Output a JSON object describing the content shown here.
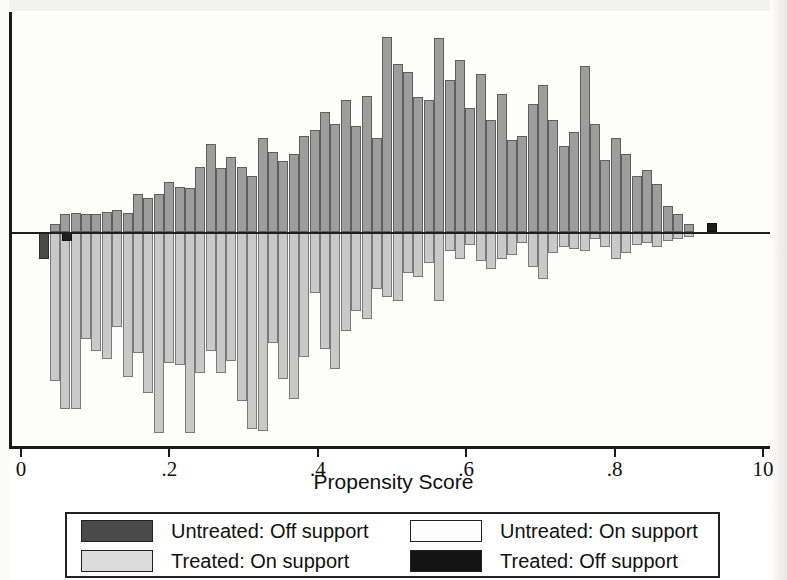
{
  "chart_data": {
    "type": "bar",
    "title": "",
    "xlabel": "Propensity Score",
    "ylabel": "",
    "xlim": [
      0,
      1
    ],
    "xticks": [
      0,
      0.2,
      0.4,
      0.6,
      0.8,
      1.0
    ],
    "xticklabels": [
      "0",
      ".2",
      ".4",
      ".6",
      ".8",
      "10"
    ],
    "grid": false,
    "legend_position": "below-axis",
    "orientation": "back-to-back histogram (untreated above zero, treated below zero)",
    "bin_width": 0.0125,
    "series": [
      {
        "name": "Untreated: On support",
        "color": "#9d9d9d",
        "direction": "up",
        "x": [
          0.034,
          0.047,
          0.061,
          0.075,
          0.089,
          0.103,
          0.117,
          0.131,
          0.145,
          0.159,
          0.173,
          0.187,
          0.201,
          0.215,
          0.229,
          0.243,
          0.257,
          0.271,
          0.285,
          0.299,
          0.313,
          0.327,
          0.341,
          0.355,
          0.369,
          0.383,
          0.397,
          0.411,
          0.425,
          0.439,
          0.453,
          0.467,
          0.481,
          0.495,
          0.509,
          0.523,
          0.537,
          0.551,
          0.565,
          0.579,
          0.593,
          0.607,
          0.621,
          0.635,
          0.649,
          0.663,
          0.677,
          0.691,
          0.705,
          0.719,
          0.733,
          0.747,
          0.761,
          0.775,
          0.789,
          0.803,
          0.817,
          0.831,
          0.845,
          0.859,
          0.873,
          0.887,
          0.901,
          0.915
        ],
        "values": [
          0,
          8,
          18,
          19,
          18,
          18,
          20,
          22,
          19,
          38,
          34,
          38,
          50,
          45,
          44,
          65,
          88,
          64,
          75,
          65,
          56,
          94,
          80,
          71,
          78,
          96,
          102,
          120,
          108,
          132,
          106,
          136,
          94,
          195,
          168,
          160,
          135,
          132,
          194,
          152,
          172,
          124,
          158,
          112,
          138,
          92,
          96,
          128,
          147,
          112,
          86,
          100,
          166,
          108,
          72,
          94,
          78,
          56,
          62,
          48,
          26,
          18,
          8,
          0
        ]
      },
      {
        "name": "Untreated: Off support",
        "color": "#4a4a4a",
        "direction": "down",
        "x": [
          0.033
        ],
        "values": [
          26
        ]
      },
      {
        "name": "Treated: On support",
        "color": "#c9c9c9",
        "direction": "down",
        "x": [
          0.047,
          0.061,
          0.075,
          0.089,
          0.103,
          0.117,
          0.131,
          0.145,
          0.159,
          0.173,
          0.187,
          0.201,
          0.215,
          0.229,
          0.243,
          0.257,
          0.271,
          0.285,
          0.299,
          0.313,
          0.327,
          0.341,
          0.355,
          0.369,
          0.383,
          0.397,
          0.411,
          0.425,
          0.439,
          0.453,
          0.467,
          0.481,
          0.495,
          0.509,
          0.523,
          0.537,
          0.551,
          0.565,
          0.579,
          0.593,
          0.607,
          0.621,
          0.635,
          0.649,
          0.663,
          0.677,
          0.691,
          0.705,
          0.719,
          0.733,
          0.747,
          0.761,
          0.775,
          0.789,
          0.803,
          0.817,
          0.831,
          0.845,
          0.859,
          0.873,
          0.887,
          0.901
        ],
        "values": [
          148,
          176,
          176,
          106,
          118,
          126,
          94,
          144,
          120,
          160,
          200,
          130,
          132,
          200,
          140,
          118,
          140,
          128,
          168,
          196,
          198,
          110,
          146,
          166,
          124,
          60,
          116,
          136,
          98,
          78,
          86,
          56,
          64,
          68,
          40,
          44,
          30,
          68,
          18,
          26,
          12,
          28,
          36,
          26,
          22,
          10,
          34,
          46,
          20,
          14,
          16,
          18,
          6,
          14,
          26,
          20,
          12,
          10,
          14,
          8,
          6,
          4
        ]
      },
      {
        "name": "Treated: Off support",
        "color": "#1e1e1e",
        "direction": "down",
        "x": [
          0.063
        ],
        "values": [
          8
        ],
        "note": "small dark cap at base of treated bar near 0.06; also a small dark bar just above zero near 0.935"
      },
      {
        "name": "Treated: Off support (right tail)",
        "color": "#1e1e1e",
        "direction": "up",
        "x": [
          0.932
        ],
        "values": [
          9
        ]
      }
    ]
  },
  "axis": {
    "title": "Propensity Score",
    "ticks": [
      {
        "value": 0,
        "label": "0"
      },
      {
        "value": 0.2,
        "label": ".2"
      },
      {
        "value": 0.4,
        "label": ".4"
      },
      {
        "value": 0.6,
        "label": ".6"
      },
      {
        "value": 0.8,
        "label": ".8"
      },
      {
        "value": 1.0,
        "label": "10"
      }
    ]
  },
  "legend": {
    "entries": [
      {
        "label": "Untreated: Off support",
        "swatch": "untreated-off",
        "color": "#4a4a4a"
      },
      {
        "label": "Untreated: On support",
        "swatch": "untreated-on",
        "color": "#fdfdfd"
      },
      {
        "label": "Treated: On support",
        "swatch": "treated-on",
        "color": "#dcdcdc"
      },
      {
        "label": "Treated: Off support",
        "swatch": "treated-off",
        "color": "#141414"
      }
    ]
  }
}
